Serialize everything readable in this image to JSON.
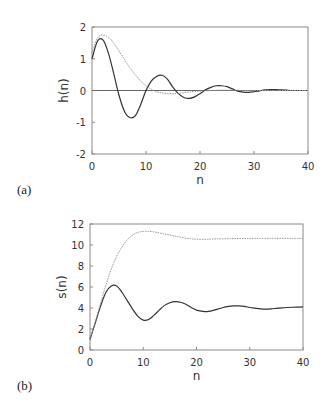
{
  "chart_data": [
    {
      "type": "line",
      "panel_label": "(a)",
      "title": "",
      "xlabel": "n",
      "ylabel": "h(n)",
      "xlim": [
        0,
        40
      ],
      "ylim": [
        -2,
        2
      ],
      "xticks": [
        0,
        10,
        20,
        30,
        40
      ],
      "yticks": [
        -2,
        -1,
        0,
        1,
        2
      ],
      "grid": false,
      "zero_line": true,
      "legend": null,
      "frame": {
        "x0": 92,
        "x1": 308,
        "ytop": 27,
        "ybottom": 154
      },
      "series": [
        {
          "name": "solid",
          "style": "solid",
          "color": "#333333",
          "x": [
            0,
            1,
            2,
            3,
            4,
            5,
            6,
            7,
            8,
            9,
            10,
            11,
            12,
            13,
            14,
            15,
            16,
            17,
            18,
            19,
            20,
            21,
            22,
            23,
            24,
            25,
            26,
            27,
            28,
            29,
            30,
            31,
            32,
            33,
            34,
            35,
            36,
            37,
            38,
            39,
            40
          ],
          "values": [
            1.0,
            1.55,
            1.6,
            1.2,
            0.55,
            -0.15,
            -0.65,
            -0.85,
            -0.8,
            -0.45,
            0.0,
            0.3,
            0.45,
            0.48,
            0.35,
            0.1,
            -0.1,
            -0.22,
            -0.25,
            -0.2,
            -0.1,
            0.02,
            0.1,
            0.15,
            0.15,
            0.12,
            0.05,
            -0.02,
            -0.05,
            -0.06,
            -0.04,
            -0.01,
            0.02,
            0.03,
            0.03,
            0.02,
            0.01,
            0.0,
            0.0,
            0.0,
            0.0
          ]
        },
        {
          "name": "dotted",
          "style": "dotted",
          "color": "#999999",
          "x": [
            0,
            1,
            2,
            3,
            4,
            5,
            6,
            7,
            8,
            9,
            10,
            11,
            12,
            13,
            14,
            15,
            16,
            17,
            18,
            19,
            20,
            22,
            24,
            26,
            28,
            30,
            32,
            34,
            36,
            38,
            40
          ],
          "values": [
            1.2,
            1.65,
            1.75,
            1.68,
            1.5,
            1.25,
            0.98,
            0.72,
            0.5,
            0.3,
            0.15,
            0.04,
            -0.04,
            -0.08,
            -0.1,
            -0.1,
            -0.09,
            -0.07,
            -0.05,
            -0.03,
            -0.02,
            0.0,
            0.01,
            0.01,
            0.0,
            0.0,
            0.0,
            0.0,
            0.0,
            0.0,
            0.0
          ]
        }
      ]
    },
    {
      "type": "line",
      "panel_label": "(b)",
      "title": "",
      "xlabel": "n",
      "ylabel": "s(n)",
      "xlim": [
        0,
        40
      ],
      "ylim": [
        0,
        12
      ],
      "xticks": [
        0,
        10,
        20,
        30,
        40
      ],
      "yticks": [
        0,
        2,
        4,
        6,
        8,
        10,
        12
      ],
      "grid": false,
      "zero_line": false,
      "legend": null,
      "frame": {
        "x0": 90,
        "x1": 303,
        "ytop": 224,
        "ybottom": 350
      },
      "series": [
        {
          "name": "solid",
          "style": "solid",
          "color": "#333333",
          "x": [
            0,
            1,
            2,
            3,
            4,
            5,
            6,
            7,
            8,
            9,
            10,
            11,
            12,
            13,
            14,
            15,
            16,
            17,
            18,
            19,
            20,
            21,
            22,
            23,
            24,
            25,
            26,
            27,
            28,
            29,
            30,
            31,
            32,
            33,
            34,
            35,
            36,
            37,
            38,
            39,
            40
          ],
          "values": [
            1.0,
            2.6,
            4.2,
            5.5,
            6.1,
            6.1,
            5.5,
            4.7,
            3.9,
            3.2,
            2.85,
            2.9,
            3.3,
            3.8,
            4.25,
            4.5,
            4.6,
            4.55,
            4.35,
            4.05,
            3.8,
            3.7,
            3.65,
            3.75,
            3.9,
            4.05,
            4.15,
            4.2,
            4.2,
            4.15,
            4.05,
            3.98,
            3.92,
            3.9,
            3.92,
            3.97,
            4.02,
            4.05,
            4.07,
            4.08,
            4.1
          ]
        },
        {
          "name": "dotted",
          "style": "dotted",
          "color": "#999999",
          "x": [
            0,
            1,
            2,
            3,
            4,
            5,
            6,
            7,
            8,
            9,
            10,
            11,
            12,
            13,
            14,
            15,
            16,
            17,
            18,
            19,
            20,
            22,
            24,
            26,
            28,
            30,
            32,
            34,
            36,
            38,
            40
          ],
          "values": [
            1.0,
            2.7,
            4.5,
            6.2,
            7.7,
            8.9,
            9.8,
            10.5,
            10.95,
            11.2,
            11.3,
            11.3,
            11.25,
            11.15,
            11.05,
            10.95,
            10.85,
            10.75,
            10.65,
            10.6,
            10.55,
            10.55,
            10.58,
            10.6,
            10.62,
            10.63,
            10.63,
            10.63,
            10.63,
            10.63,
            10.63
          ]
        }
      ]
    }
  ]
}
